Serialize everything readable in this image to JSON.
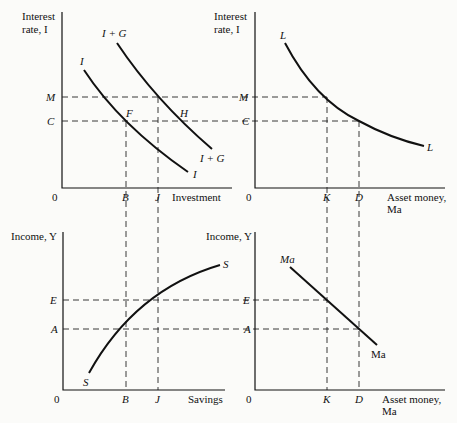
{
  "panels": {
    "top_left": {
      "y_axis_label": [
        "Interest",
        "rate, I"
      ],
      "x_axis_label": "Investment",
      "origin": "0",
      "y_ticks": [
        "M",
        "C"
      ],
      "x_ticks": [
        "B",
        "J"
      ],
      "curves": [
        {
          "name": "I",
          "label_start": "I",
          "label_end": "I"
        },
        {
          "name": "I + G",
          "label_start": "I + G",
          "label_end": "I + G"
        }
      ],
      "points": [
        "F",
        "H"
      ]
    },
    "top_right": {
      "y_axis_label": [
        "Interest",
        "rate, I"
      ],
      "x_axis_label": [
        "Asset money,",
        "Ma"
      ],
      "origin": "0",
      "y_ticks": [
        "M",
        "C"
      ],
      "x_ticks": [
        "K",
        "D"
      ],
      "curves": [
        {
          "name": "L",
          "label_start": "L",
          "label_end": "L"
        }
      ]
    },
    "bottom_left": {
      "y_axis_label": "Income, Y",
      "x_axis_label": "Savings",
      "origin": "0",
      "y_ticks": [
        "E",
        "A"
      ],
      "x_ticks": [
        "B",
        "J"
      ],
      "curves": [
        {
          "name": "S",
          "label_start": "S",
          "label_end": "S"
        }
      ]
    },
    "bottom_right": {
      "y_axis_label": "Income, Y",
      "x_axis_label": [
        "Asset money,",
        "Ma"
      ],
      "origin": "0",
      "y_ticks": [
        "E",
        "A"
      ],
      "x_ticks": [
        "K",
        "D"
      ],
      "curves": [
        {
          "name": "Ma",
          "label_start": "Ma",
          "label_end": "Ma"
        }
      ]
    }
  }
}
